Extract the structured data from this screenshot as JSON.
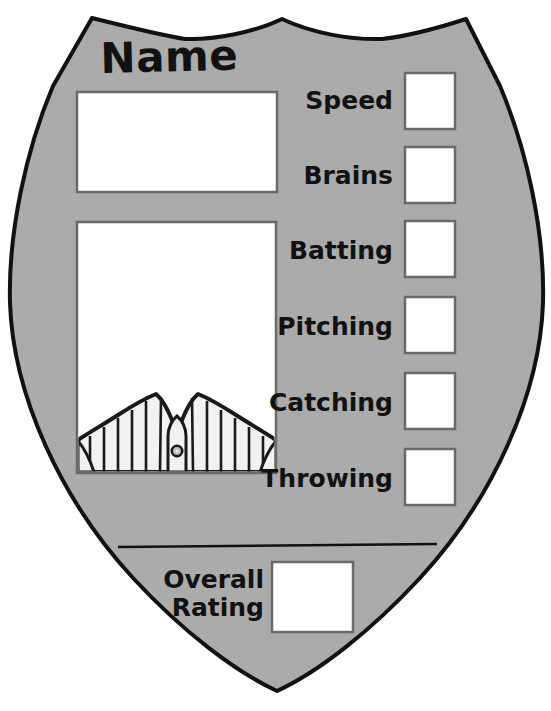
{
  "card": {
    "kind": "baseball-player-trading-card-template",
    "shape": "shield",
    "title": "Name",
    "colors": {
      "shield_fill": "#ababab",
      "outline": "#111111",
      "box_fill": "#ffffff",
      "box_border": "#6a6a6a",
      "jersey_fill": "#f2f2f2",
      "jersey_stripe": "#1a1a1a",
      "text": "#111111"
    },
    "name_field": {
      "value": "",
      "placeholder": ""
    },
    "photo_field": {
      "value": "",
      "illustration": "baseball-jersey-pinstripe-collar"
    },
    "stats": [
      {
        "label": "Speed",
        "value": ""
      },
      {
        "label": "Brains",
        "value": ""
      },
      {
        "label": "Batting",
        "value": ""
      },
      {
        "label": "Pitching",
        "value": ""
      },
      {
        "label": "Catching",
        "value": ""
      },
      {
        "label": "Throwing",
        "value": ""
      }
    ],
    "overall": {
      "label_line1": "Overall",
      "label_line2": "Rating",
      "value": ""
    },
    "divider": {
      "present": true
    }
  }
}
